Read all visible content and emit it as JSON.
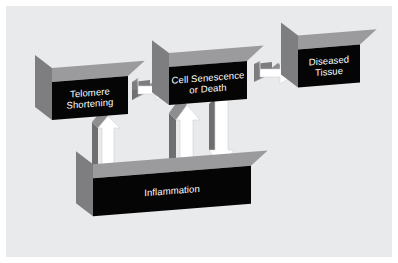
{
  "figure": {
    "type": "flow-diagram",
    "background_color": "#e9eaec",
    "page_color": "#ffffff",
    "box_face_color": "#050505",
    "box_top_color": "#9b9b9d",
    "box_side_color": "#7e7e80",
    "arrow_face_color": "#ffffff",
    "arrow_side_color": "#9b9b9d",
    "label_color": "#ffffff"
  },
  "nodes": {
    "telomere": {
      "label": "Telomere\nShortening",
      "line1": "Telomere",
      "line2": "Shortening"
    },
    "senescence": {
      "label": "Cell Senescence\nor Death",
      "line1": "Cell Senescence",
      "line2": "or Death"
    },
    "diseased": {
      "label": "Diseased\nTissue",
      "line1": "Diseased",
      "line2": "Tissue"
    },
    "inflammation": {
      "label": "Inflammation",
      "line1": "Inflammation",
      "line2": ""
    }
  },
  "edges": [
    {
      "id": "telomere-to-senescence",
      "from": "telomere",
      "to": "senescence",
      "direction": "right"
    },
    {
      "id": "senescence-to-diseased",
      "from": "senescence",
      "to": "diseased",
      "direction": "right"
    },
    {
      "id": "inflammation-to-telomere",
      "from": "inflammation",
      "to": "telomere",
      "direction": "up"
    },
    {
      "id": "inflammation-to-senescence",
      "from": "inflammation",
      "to": "senescence",
      "direction": "up"
    },
    {
      "id": "senescence-to-inflammation",
      "from": "senescence",
      "to": "inflammation",
      "direction": "down"
    }
  ]
}
